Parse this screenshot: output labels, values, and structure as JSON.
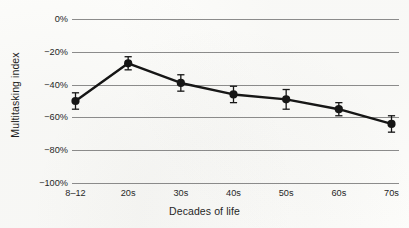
{
  "chart_data": {
    "type": "line",
    "title": "",
    "xlabel": "Decades of life",
    "ylabel": "Multitasking index",
    "categories": [
      "8–12",
      "20s",
      "30s",
      "40s",
      "50s",
      "60s",
      "70s"
    ],
    "values": [
      -50,
      -27,
      -39,
      -46,
      -49,
      -55,
      -64
    ],
    "errors": [
      5,
      4,
      5,
      5,
      6,
      4,
      5
    ],
    "ylim": [
      -100,
      0
    ],
    "ytick_values": [
      0,
      -20,
      -40,
      -60,
      -80,
      -100
    ],
    "ytick_labels": [
      "0%",
      "−20%",
      "−40%",
      "−60%",
      "−80%",
      "−100%"
    ],
    "grid": true,
    "legend": "none",
    "series": [
      {
        "name": "Multitasking index",
        "values": [
          -50,
          -27,
          -39,
          -46,
          -49,
          -55,
          -64
        ],
        "errors": [
          5,
          4,
          5,
          5,
          6,
          4,
          5
        ],
        "marker": "filled-circle",
        "color": "#121212"
      }
    ],
    "value_labels": [
      "−50%",
      "−27%",
      "−39%",
      "−46%",
      "−49%",
      "−55%",
      "−64%"
    ],
    "gridline_color": "#8c8c8c",
    "line_color": "#121212",
    "background_color": "#fdfdfb"
  }
}
